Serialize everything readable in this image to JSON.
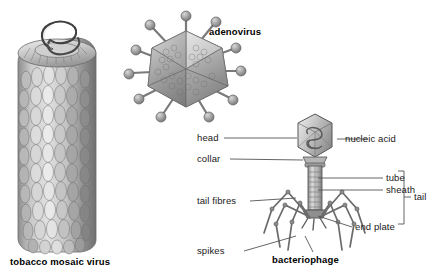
{
  "figure": {
    "background_color": "#ffffff",
    "ink_color": "#1a1a1a",
    "style": "grayscale engraving"
  },
  "specimens": [
    {
      "id": "tobacco-mosaic-virus",
      "caption": "tobacco mosaic virus",
      "bold": true
    },
    {
      "id": "adenovirus",
      "caption": "adenovirus",
      "bold": true
    },
    {
      "id": "bacteriophage",
      "caption": "bacteriophage",
      "bold": true
    }
  ],
  "labels": {
    "tobacco_mosaic_virus": "tobacco mosaic virus",
    "adenovirus": "adenovirus",
    "bacteriophage": "bacteriophage",
    "head": "head",
    "collar": "collar",
    "nucleic_acid": "nucleic acid",
    "tube": "tube",
    "sheath": "sheath",
    "tail": "tail",
    "tail_fibres": "tail fibres",
    "end_plate": "end plate",
    "spikes": "spikes"
  }
}
